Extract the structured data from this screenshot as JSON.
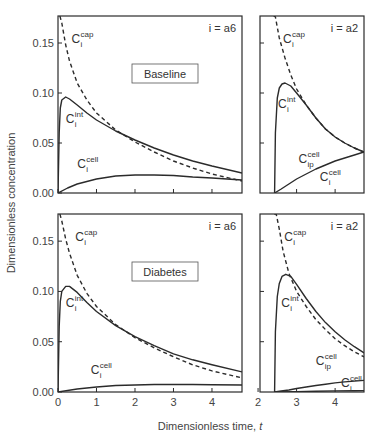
{
  "figure": {
    "ylabel": "Dimensionless concentration",
    "xlabel": "Dimensionless time, ",
    "xlabel_var": "t"
  },
  "chart_data": [
    {
      "type": "line",
      "panel": "top-left",
      "condition_label": "Baseline",
      "species_label": "i = a6",
      "xlim": [
        0,
        4.78
      ],
      "ylim": [
        0,
        0.177
      ],
      "xticks": [
        0,
        1,
        2,
        3,
        4
      ],
      "xtick_labels_shown": false,
      "yticks": [
        0.0,
        0.05,
        0.1,
        0.15
      ],
      "ytick_labels": [
        "0.00",
        "0.05",
        "0.10",
        "0.15"
      ],
      "series": [
        {
          "name": "C_i^cap",
          "style": "dashed",
          "x": [
            0.05,
            0.1,
            0.2,
            0.3,
            0.5,
            0.75,
            1.0,
            1.5,
            2.0,
            2.5,
            3.0,
            3.5,
            4.0,
            4.78
          ],
          "y": [
            0.177,
            0.17,
            0.148,
            0.132,
            0.11,
            0.093,
            0.08,
            0.063,
            0.051,
            0.041,
            0.032,
            0.025,
            0.019,
            0.012
          ]
        },
        {
          "name": "C_i^int",
          "style": "solid",
          "x": [
            0.0,
            0.03,
            0.06,
            0.1,
            0.2,
            0.3,
            0.5,
            0.75,
            1.0,
            1.5,
            2.0,
            2.5,
            3.0,
            3.5,
            4.0,
            4.78
          ],
          "y": [
            0.0,
            0.06,
            0.085,
            0.093,
            0.096,
            0.094,
            0.088,
            0.08,
            0.073,
            0.062,
            0.053,
            0.045,
            0.038,
            0.032,
            0.027,
            0.02
          ]
        },
        {
          "name": "C_i^cell",
          "style": "solid",
          "x": [
            0.0,
            0.25,
            0.5,
            1.0,
            1.5,
            2.0,
            2.5,
            3.0,
            3.5,
            4.0,
            4.78
          ],
          "y": [
            0.0,
            0.005,
            0.009,
            0.014,
            0.017,
            0.018,
            0.018,
            0.0175,
            0.016,
            0.015,
            0.013
          ]
        }
      ],
      "annotations": [
        {
          "text": "C",
          "sup": "cap",
          "sub": "i",
          "x": 0.35,
          "y": 0.15
        },
        {
          "text": "C",
          "sup": "int",
          "sub": "i",
          "x": 0.2,
          "y": 0.07
        },
        {
          "text": "C",
          "sup": "cell",
          "sub": "i",
          "x": 0.5,
          "y": 0.025
        }
      ]
    },
    {
      "type": "line",
      "panel": "top-right",
      "species_label": "i = a2",
      "xlim": [
        2.05,
        4.75
      ],
      "ylim": [
        0,
        0.177
      ],
      "xticks": [
        3,
        4
      ],
      "xtick_labels_shown": false,
      "yticks": [
        0.05,
        0.1,
        0.15
      ],
      "series": [
        {
          "name": "C_i^cap",
          "style": "dashed",
          "x": [
            2.4,
            2.42,
            2.45,
            2.55,
            2.7,
            2.85,
            3.0,
            3.25,
            3.5,
            3.75,
            4.0,
            4.25,
            4.5,
            4.75
          ],
          "y": [
            0.177,
            0.177,
            0.176,
            0.155,
            0.135,
            0.118,
            0.104,
            0.088,
            0.075,
            0.064,
            0.056,
            0.05,
            0.045,
            0.041
          ]
        },
        {
          "name": "C_i^int",
          "style": "solid",
          "x": [
            2.43,
            2.45,
            2.5,
            2.55,
            2.62,
            2.7,
            2.85,
            3.0,
            3.25,
            3.5,
            3.75,
            4.0,
            4.25,
            4.5,
            4.75
          ],
          "y": [
            0.0,
            0.06,
            0.095,
            0.105,
            0.109,
            0.11,
            0.107,
            0.1,
            0.088,
            0.075,
            0.064,
            0.056,
            0.05,
            0.045,
            0.041
          ]
        },
        {
          "name": "C_ip^cell",
          "style": "solid",
          "x": [
            2.43,
            2.6,
            2.8,
            3.0,
            3.25,
            3.5,
            3.75,
            4.0,
            4.25,
            4.5,
            4.75
          ],
          "y": [
            0.0,
            0.004,
            0.009,
            0.014,
            0.019,
            0.024,
            0.028,
            0.032,
            0.035,
            0.038,
            0.041
          ]
        }
      ],
      "annotations": [
        {
          "text": "C",
          "sup": "cap",
          "sub": "i",
          "x": 2.65,
          "y": 0.15
        },
        {
          "text": "C",
          "sup": "int",
          "sub": "i",
          "x": 2.52,
          "y": 0.085
        },
        {
          "text": "C",
          "sup": "cell",
          "sub": "ip",
          "x": 3.05,
          "y": 0.03
        },
        {
          "text": "C",
          "sup": "cell",
          "sub": "i",
          "x": 3.6,
          "y": 0.012
        }
      ]
    },
    {
      "type": "line",
      "panel": "bottom-left",
      "condition_label": "Diabetes",
      "species_label": "i = a6",
      "xlim": [
        0,
        4.78
      ],
      "ylim": [
        0,
        0.177
      ],
      "xticks": [
        0,
        1,
        2,
        3,
        4
      ],
      "xtick_labels": [
        "0",
        "1",
        "2",
        "3",
        "4"
      ],
      "yticks": [
        0.0,
        0.05,
        0.1,
        0.15
      ],
      "ytick_labels": [
        "0.00",
        "0.05",
        "0.10",
        "0.15"
      ],
      "series": [
        {
          "name": "C_i^cap",
          "style": "dashed",
          "x": [
            0.05,
            0.1,
            0.2,
            0.3,
            0.5,
            0.75,
            1.0,
            1.5,
            2.0,
            2.5,
            3.0,
            3.5,
            4.0,
            4.78
          ],
          "y": [
            0.177,
            0.17,
            0.152,
            0.138,
            0.116,
            0.098,
            0.085,
            0.067,
            0.054,
            0.044,
            0.035,
            0.027,
            0.021,
            0.014
          ]
        },
        {
          "name": "C_i^int",
          "style": "solid",
          "x": [
            0.0,
            0.03,
            0.06,
            0.1,
            0.2,
            0.3,
            0.5,
            0.75,
            1.0,
            1.5,
            2.0,
            2.5,
            3.0,
            3.5,
            4.0,
            4.78
          ],
          "y": [
            0.0,
            0.065,
            0.09,
            0.1,
            0.105,
            0.105,
            0.099,
            0.089,
            0.08,
            0.066,
            0.055,
            0.046,
            0.038,
            0.032,
            0.027,
            0.02
          ]
        },
        {
          "name": "C_i^cell",
          "style": "solid",
          "x": [
            0.0,
            0.5,
            1.0,
            1.5,
            2.0,
            2.5,
            3.0,
            3.5,
            4.0,
            4.78
          ],
          "y": [
            0.0,
            0.003,
            0.005,
            0.0065,
            0.007,
            0.0075,
            0.0075,
            0.0075,
            0.0073,
            0.007
          ]
        }
      ],
      "annotations": [
        {
          "text": "C",
          "sup": "cap",
          "sub": "i",
          "x": 0.45,
          "y": 0.15
        },
        {
          "text": "C",
          "sup": "int",
          "sub": "i",
          "x": 0.2,
          "y": 0.085
        },
        {
          "text": "C",
          "sup": "cell",
          "sub": "i",
          "x": 0.85,
          "y": 0.018
        }
      ]
    },
    {
      "type": "line",
      "panel": "bottom-right",
      "species_label": "i = a2",
      "xlim": [
        2.05,
        4.75
      ],
      "ylim": [
        0,
        0.177
      ],
      "xticks": [
        2,
        3,
        4
      ],
      "xtick_labels": [
        "2",
        "3",
        "4"
      ],
      "yticks": [
        0.05,
        0.1,
        0.15
      ],
      "series": [
        {
          "name": "C_i^cap",
          "style": "dashed",
          "x": [
            2.42,
            2.44,
            2.47,
            2.55,
            2.65,
            2.8,
            3.0,
            3.25,
            3.5,
            3.75,
            4.0,
            4.25,
            4.5,
            4.75
          ],
          "y": [
            0.177,
            0.177,
            0.177,
            0.162,
            0.14,
            0.118,
            0.1,
            0.085,
            0.072,
            0.062,
            0.053,
            0.046,
            0.04,
            0.035
          ]
        },
        {
          "name": "C_i^int",
          "style": "solid",
          "x": [
            2.43,
            2.45,
            2.5,
            2.55,
            2.62,
            2.72,
            2.85,
            3.0,
            3.25,
            3.5,
            3.75,
            4.0,
            4.25,
            4.5,
            4.75
          ],
          "y": [
            0.0,
            0.06,
            0.095,
            0.108,
            0.115,
            0.117,
            0.115,
            0.107,
            0.093,
            0.08,
            0.069,
            0.06,
            0.052,
            0.045,
            0.039
          ]
        },
        {
          "name": "C_ip^cell",
          "style": "solid",
          "x": [
            2.43,
            2.6,
            2.8,
            3.0,
            3.25,
            3.5,
            3.75,
            4.0,
            4.25,
            4.5,
            4.75
          ],
          "y": [
            0.0,
            0.001,
            0.002,
            0.0035,
            0.005,
            0.0065,
            0.0078,
            0.009,
            0.01,
            0.0108,
            0.0115
          ]
        },
        {
          "name": "C_i^cell",
          "style": "solid",
          "x": [
            2.43,
            3.0,
            3.5,
            4.0,
            4.5,
            4.75
          ],
          "y": [
            0.0,
            0.0004,
            0.0008,
            0.0011,
            0.0013,
            0.0014
          ]
        }
      ],
      "annotations": [
        {
          "text": "C",
          "sup": "cap",
          "sub": "i",
          "x": 2.68,
          "y": 0.15
        },
        {
          "text": "C",
          "sup": "int",
          "sub": "i",
          "x": 2.6,
          "y": 0.085
        },
        {
          "text": "C",
          "sup": "cell",
          "sub": "ip",
          "x": 3.5,
          "y": 0.027
        },
        {
          "text": "C",
          "sup": "cell",
          "sub": "i",
          "x": 4.15,
          "y": 0.005
        }
      ]
    }
  ]
}
